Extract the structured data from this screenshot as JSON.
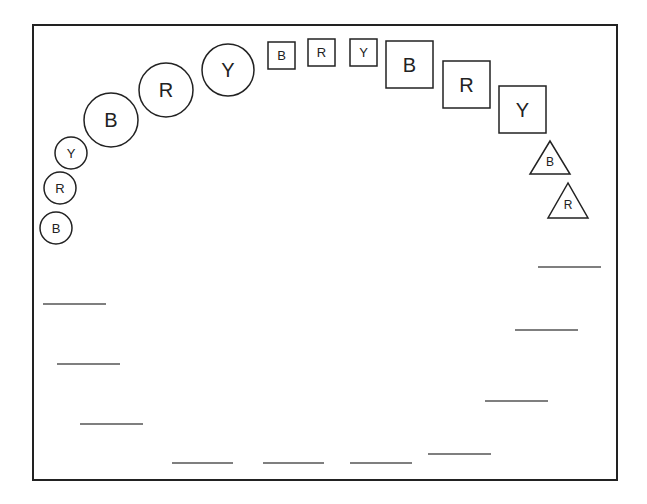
{
  "diagram": {
    "title": "",
    "stroke_color": "#222222",
    "line_color": "#555555",
    "background": "#ffffff",
    "frame": {
      "x": 33,
      "y": 25,
      "width": 584,
      "height": 455
    },
    "small_circles": [
      {
        "label": "Y",
        "cx": 71,
        "cy": 153,
        "r": 16
      },
      {
        "label": "R",
        "cx": 60,
        "cy": 188,
        "r": 16
      },
      {
        "label": "B",
        "cx": 56,
        "cy": 228,
        "r": 16
      }
    ],
    "large_circles": [
      {
        "label": "B",
        "cx": 111,
        "cy": 120,
        "r": 27
      },
      {
        "label": "R",
        "cx": 166,
        "cy": 90,
        "r": 27
      },
      {
        "label": "Y",
        "cx": 228,
        "cy": 70,
        "r": 26
      }
    ],
    "small_squares": [
      {
        "label": "B",
        "x": 268,
        "y": 42,
        "size": 27
      },
      {
        "label": "R",
        "x": 308,
        "y": 39,
        "size": 27
      },
      {
        "label": "Y",
        "x": 350,
        "y": 39,
        "size": 27
      }
    ],
    "large_squares": [
      {
        "label": "B",
        "x": 386,
        "y": 41,
        "size": 47
      },
      {
        "label": "R",
        "x": 443,
        "y": 61,
        "size": 47
      },
      {
        "label": "Y",
        "x": 499,
        "y": 86,
        "size": 47
      }
    ],
    "triangles": [
      {
        "label": "B",
        "apex_x": 550,
        "apex_y": 141,
        "base_y": 174,
        "half_width": 20
      },
      {
        "label": "R",
        "apex_x": 568,
        "apex_y": 183,
        "base_y": 218,
        "half_width": 20
      }
    ],
    "blank_lines": [
      {
        "x1": 43,
        "x2": 106,
        "y": 304
      },
      {
        "x1": 57,
        "x2": 120,
        "y": 364
      },
      {
        "x1": 80,
        "x2": 143,
        "y": 424
      },
      {
        "x1": 172,
        "x2": 233,
        "y": 463
      },
      {
        "x1": 263,
        "x2": 324,
        "y": 463
      },
      {
        "x1": 350,
        "x2": 412,
        "y": 463
      },
      {
        "x1": 428,
        "x2": 491,
        "y": 454
      },
      {
        "x1": 485,
        "x2": 548,
        "y": 401
      },
      {
        "x1": 515,
        "x2": 578,
        "y": 330
      },
      {
        "x1": 538,
        "x2": 601,
        "y": 267
      }
    ]
  }
}
